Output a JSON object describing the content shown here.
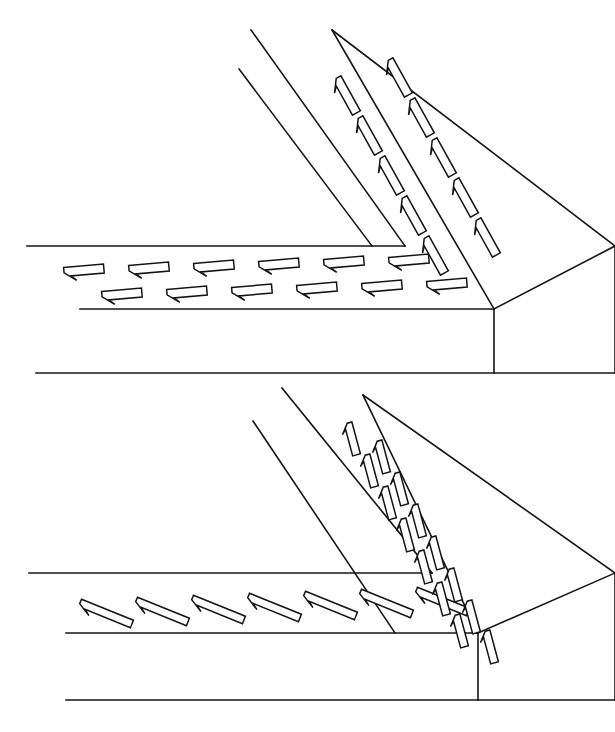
{
  "canvas": {
    "width": 615,
    "height": 732,
    "background": "#ffffff",
    "ink": "#141414"
  },
  "document": {
    "kind": "technical-line-drawing",
    "description": "Two isometric line drawings of an L-shaped corner slab or roadway, each marked with directional arrow markings on the top surface",
    "figure_count": 2
  },
  "figures": [
    {
      "id": "figure-top",
      "label": "upper-corner-assembly",
      "offset_y": 0,
      "viewbox": "0 0 615 390",
      "marking_style": "flat-wide-arrows",
      "marking_angle_deg": 8,
      "outline_paths": [
        "M 27 246 L 405 246",
        "M 36 373 L 615 373",
        "M 80 309 L 494 309",
        "M 494 309 L 615 246",
        "M 494 309 L 494 373",
        "M 615 246 L 615 373",
        "M 251 30 L 405 246",
        "M 239 69 L 372 246",
        "M 332 30 L 494 309",
        "M 332 30 L 615 246"
      ],
      "horizontal_band": {
        "rows": 2,
        "arrows_per_row": 6,
        "direction": "left",
        "row_top_count": 6,
        "row_bottom_count": 6
      },
      "diagonal_band": {
        "columns": 2,
        "direction": "up-left",
        "column_inner_count": 5,
        "column_outer_count": 5
      }
    },
    {
      "id": "figure-bottom",
      "label": "lower-corner-assembly",
      "offset_y": 385,
      "viewbox": "0 0 615 347",
      "marking_style": "steep-slanted-arrows",
      "marking_angle_deg": 28,
      "outline_paths": [
        "M 29 188 L 432 188",
        "M 66 315 L 615 315",
        "M 66 248 L 478 248",
        "M 478 248 L 615 188",
        "M 478 248 L 478 315",
        "M 615 188 L 615 315",
        "M 282 3 L 432 188",
        "M 253 36 L 395 248",
        "M 363 10 L 478 248",
        "M 363 10 L 615 188"
      ],
      "horizontal_band": {
        "rows": 1,
        "arrows_per_row": 7,
        "direction": "down-right"
      },
      "diagonal_band": {
        "columns": 2,
        "direction": "down-left",
        "column_inner_count": 9,
        "column_outer_count": 8
      }
    }
  ],
  "markings": {
    "top_horizontal_row_a": [
      {
        "x": 64,
        "y": 272,
        "len": 40,
        "w": 9,
        "rot": -5
      },
      {
        "x": 129,
        "y": 270,
        "len": 40,
        "w": 9,
        "rot": -5
      },
      {
        "x": 194,
        "y": 268,
        "len": 40,
        "w": 9,
        "rot": -5
      },
      {
        "x": 259,
        "y": 266,
        "len": 40,
        "w": 9,
        "rot": -5
      },
      {
        "x": 324,
        "y": 264,
        "len": 40,
        "w": 9,
        "rot": -5
      },
      {
        "x": 389,
        "y": 262,
        "len": 40,
        "w": 9,
        "rot": -5
      }
    ],
    "top_horizontal_row_b": [
      {
        "x": 102,
        "y": 296,
        "len": 40,
        "w": 9,
        "rot": -5
      },
      {
        "x": 167,
        "y": 294,
        "len": 40,
        "w": 9,
        "rot": -5
      },
      {
        "x": 232,
        "y": 292,
        "len": 40,
        "w": 9,
        "rot": -5
      },
      {
        "x": 297,
        "y": 290,
        "len": 40,
        "w": 9,
        "rot": -5
      },
      {
        "x": 362,
        "y": 288,
        "len": 40,
        "w": 9,
        "rot": -5
      },
      {
        "x": 427,
        "y": 286,
        "len": 40,
        "w": 9,
        "rot": -5
      }
    ],
    "top_diagonal_col_a": [
      {
        "x": 337,
        "y": 78,
        "len": 40,
        "w": 9,
        "rot": 61
      },
      {
        "x": 359,
        "y": 118,
        "len": 40,
        "w": 9,
        "rot": 61
      },
      {
        "x": 381,
        "y": 158,
        "len": 40,
        "w": 9,
        "rot": 61
      },
      {
        "x": 403,
        "y": 198,
        "len": 40,
        "w": 9,
        "rot": 61
      },
      {
        "x": 425,
        "y": 238,
        "len": 40,
        "w": 9,
        "rot": 61
      }
    ],
    "top_diagonal_col_b": [
      {
        "x": 389,
        "y": 60,
        "len": 40,
        "w": 9,
        "rot": 61
      },
      {
        "x": 411,
        "y": 100,
        "len": 40,
        "w": 9,
        "rot": 61
      },
      {
        "x": 433,
        "y": 140,
        "len": 40,
        "w": 9,
        "rot": 61
      },
      {
        "x": 455,
        "y": 180,
        "len": 40,
        "w": 9,
        "rot": 61
      },
      {
        "x": 477,
        "y": 220,
        "len": 40,
        "w": 9,
        "rot": 61
      }
    ],
    "bottom_horizontal_row": [
      {
        "x": 80,
        "y": 218,
        "len": 56,
        "w": 8,
        "rot": 22
      },
      {
        "x": 136,
        "y": 216,
        "len": 56,
        "w": 8,
        "rot": 22
      },
      {
        "x": 192,
        "y": 214,
        "len": 56,
        "w": 8,
        "rot": 22
      },
      {
        "x": 248,
        "y": 212,
        "len": 56,
        "w": 8,
        "rot": 22
      },
      {
        "x": 304,
        "y": 210,
        "len": 56,
        "w": 8,
        "rot": 22
      },
      {
        "x": 360,
        "y": 208,
        "len": 56,
        "w": 8,
        "rot": 22
      },
      {
        "x": 416,
        "y": 206,
        "len": 56,
        "w": 8,
        "rot": 22
      }
    ],
    "bottom_diagonal_col_a": [
      {
        "x": 348,
        "y": 38,
        "len": 33,
        "w": 8,
        "rot": 75
      },
      {
        "x": 366,
        "y": 70,
        "len": 33,
        "w": 8,
        "rot": 75
      },
      {
        "x": 384,
        "y": 102,
        "len": 33,
        "w": 8,
        "rot": 75
      },
      {
        "x": 402,
        "y": 134,
        "len": 33,
        "w": 8,
        "rot": 75
      },
      {
        "x": 420,
        "y": 166,
        "len": 33,
        "w": 8,
        "rot": 75
      },
      {
        "x": 438,
        "y": 198,
        "len": 33,
        "w": 8,
        "rot": 75
      },
      {
        "x": 456,
        "y": 230,
        "len": 33,
        "w": 8,
        "rot": 75
      }
    ],
    "bottom_diagonal_col_b": [
      {
        "x": 378,
        "y": 56,
        "len": 33,
        "w": 8,
        "rot": 75
      },
      {
        "x": 396,
        "y": 88,
        "len": 33,
        "w": 8,
        "rot": 75
      },
      {
        "x": 414,
        "y": 120,
        "len": 33,
        "w": 8,
        "rot": 75
      },
      {
        "x": 432,
        "y": 152,
        "len": 33,
        "w": 8,
        "rot": 75
      },
      {
        "x": 450,
        "y": 184,
        "len": 33,
        "w": 8,
        "rot": 75
      },
      {
        "x": 468,
        "y": 216,
        "len": 33,
        "w": 8,
        "rot": 75
      },
      {
        "x": 486,
        "y": 246,
        "len": 33,
        "w": 8,
        "rot": 75
      }
    ]
  }
}
